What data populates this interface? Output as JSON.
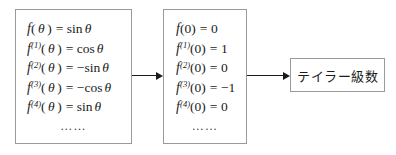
{
  "diagram": {
    "boxes": {
      "derivatives": {
        "name": "derivatives-box",
        "rows": [
          {
            "fn": "f",
            "order": "",
            "arg_open": "(",
            "arg": "θ",
            "arg_close": ")",
            "eq": "=",
            "sign": "",
            "rhs_fn": "sin",
            "rhs_var": "θ"
          },
          {
            "fn": "f",
            "order": "(1)",
            "arg_open": "(",
            "arg": "θ",
            "arg_close": ")",
            "eq": "=",
            "sign": "",
            "rhs_fn": "cos",
            "rhs_var": "θ"
          },
          {
            "fn": "f",
            "order": "(2)",
            "arg_open": "(",
            "arg": "θ",
            "arg_close": ")",
            "eq": "=",
            "sign": "−",
            "rhs_fn": "sin",
            "rhs_var": "θ"
          },
          {
            "fn": "f",
            "order": "(3)",
            "arg_open": "(",
            "arg": "θ",
            "arg_close": ")",
            "eq": "=",
            "sign": "−",
            "rhs_fn": "cos",
            "rhs_var": "θ"
          },
          {
            "fn": "f",
            "order": "(4)",
            "arg_open": "(",
            "arg": "θ",
            "arg_close": ")",
            "eq": "=",
            "sign": "",
            "rhs_fn": "sin",
            "rhs_var": "θ"
          }
        ],
        "continuation": "……"
      },
      "values": {
        "name": "values-at-zero-box",
        "rows": [
          {
            "fn": "f",
            "order": "",
            "arg_open": "(",
            "arg": "0",
            "arg_close": ")",
            "eq": "=",
            "sign": "",
            "rhs_fn": "",
            "rhs_var": "0"
          },
          {
            "fn": "f",
            "order": "(1)",
            "arg_open": "(",
            "arg": "0",
            "arg_close": ")",
            "eq": "=",
            "sign": "",
            "rhs_fn": "",
            "rhs_var": "1"
          },
          {
            "fn": "f",
            "order": "(2)",
            "arg_open": "(",
            "arg": "0",
            "arg_close": ")",
            "eq": "=",
            "sign": "",
            "rhs_fn": "",
            "rhs_var": "0"
          },
          {
            "fn": "f",
            "order": "(3)",
            "arg_open": "(",
            "arg": "0",
            "arg_close": ")",
            "eq": "=",
            "sign": "−",
            "rhs_fn": "",
            "rhs_var": "1"
          },
          {
            "fn": "f",
            "order": "(4)",
            "arg_open": "(",
            "arg": "0",
            "arg_close": ")",
            "eq": "=",
            "sign": "",
            "rhs_fn": "",
            "rhs_var": "0"
          }
        ],
        "continuation": "……"
      },
      "result": {
        "name": "result-box",
        "label": "テイラー級数"
      }
    },
    "arrows": [
      {
        "name": "arrow-derivatives-to-values",
        "direction": "right"
      },
      {
        "name": "arrow-values-to-result",
        "direction": "right"
      }
    ],
    "colors": {
      "border": "#9a9a9a",
      "text": "#1b1b1b",
      "arrow": "#1b1b1b",
      "background": "#ffffff"
    }
  }
}
